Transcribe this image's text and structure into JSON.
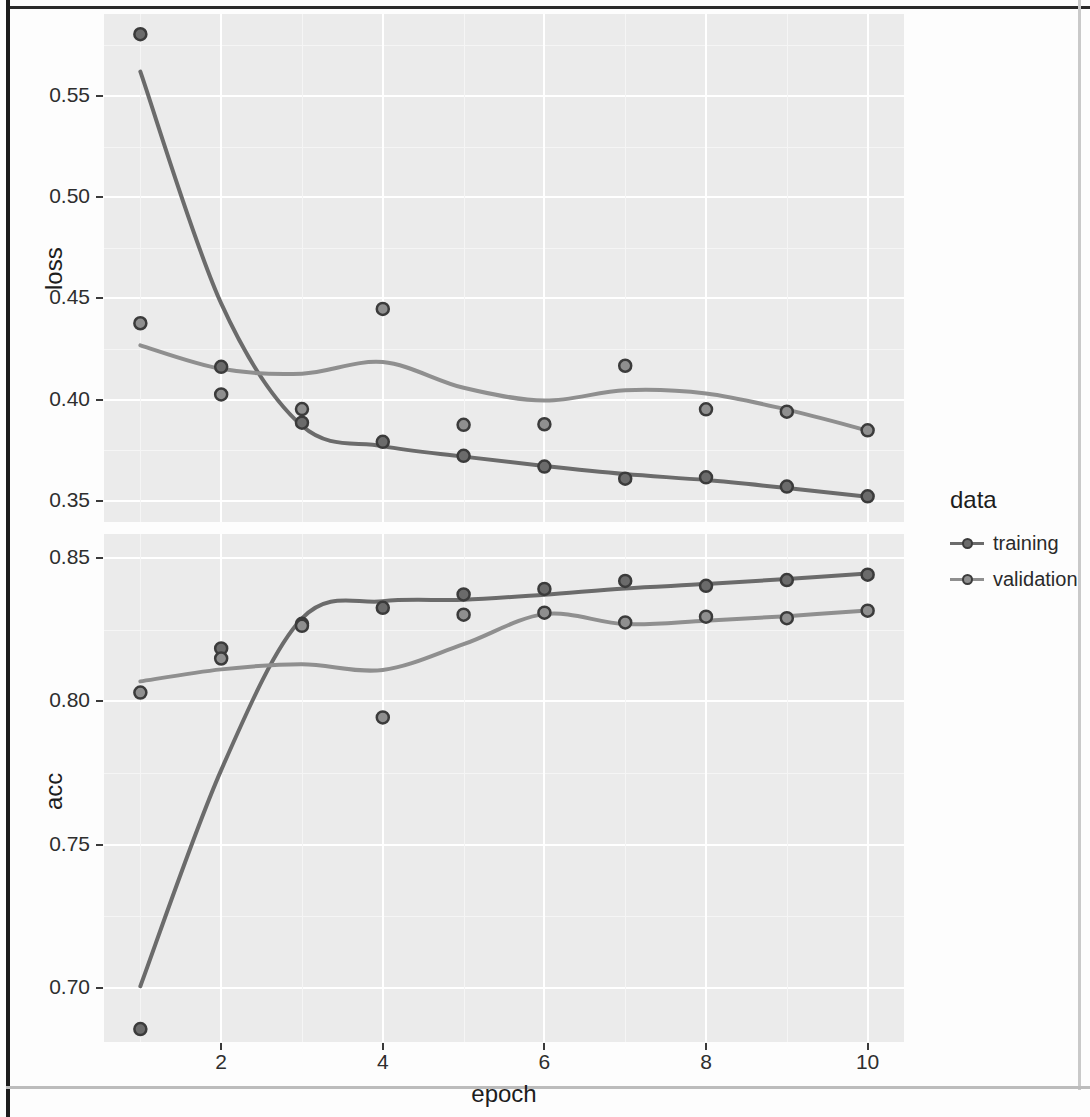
{
  "chart_data": [
    {
      "type": "scatter",
      "panel": "loss",
      "title": "",
      "xlabel": "epoch",
      "ylabel": "loss",
      "xlim": [
        0.55,
        10.45
      ],
      "ylim": [
        0.3395,
        0.5905
      ],
      "xticks": [
        2,
        4,
        6,
        8,
        10
      ],
      "xtick_labels": [
        "2",
        "4",
        "6",
        "8",
        "10"
      ],
      "yticks": [
        0.55,
        0.5,
        0.45,
        0.4,
        0.35
      ],
      "ytick_labels": [
        "0.55",
        "0.50",
        "0.45",
        "0.40",
        "0.35"
      ],
      "grid": true,
      "legend_position": "right",
      "x": [
        1,
        2,
        3,
        4,
        5,
        6,
        7,
        8,
        9,
        10
      ],
      "series": [
        {
          "name": "training",
          "values": [
            0.5805,
            0.4162,
            0.3886,
            0.3791,
            0.3722,
            0.3669,
            0.3609,
            0.3616,
            0.357,
            0.3522
          ],
          "smooth": [
            0.562,
            0.4475,
            0.387,
            0.377,
            0.3718,
            0.3672,
            0.3632,
            0.3602,
            0.3563,
            0.352
          ]
        },
        {
          "name": "validation",
          "values": [
            0.4377,
            0.4025,
            0.3953,
            0.4448,
            0.3875,
            0.3878,
            0.4167,
            0.3952,
            0.394,
            0.3848
          ],
          "smooth": [
            0.4268,
            0.4152,
            0.4128,
            0.4185,
            0.4058,
            0.3995,
            0.4046,
            0.403,
            0.395,
            0.3847
          ]
        }
      ]
    },
    {
      "type": "scatter",
      "panel": "acc",
      "title": "",
      "xlabel": "epoch",
      "ylabel": "acc",
      "xlim": [
        0.55,
        10.45
      ],
      "ylim": [
        0.681,
        0.8585
      ],
      "xticks": [
        2,
        4,
        6,
        8,
        10
      ],
      "xtick_labels": [
        "2",
        "4",
        "6",
        "8",
        "10"
      ],
      "yticks": [
        0.85,
        0.8,
        0.75,
        0.7
      ],
      "ytick_labels": [
        "0.85",
        "0.80",
        "0.75",
        "0.70"
      ],
      "grid": true,
      "legend_position": "right",
      "x": [
        1,
        2,
        3,
        4,
        5,
        6,
        7,
        8,
        9,
        10
      ],
      "series": [
        {
          "name": "training",
          "values": [
            0.6855,
            0.8185,
            0.8271,
            0.8327,
            0.8374,
            0.8393,
            0.8421,
            0.8404,
            0.8424,
            0.8443
          ],
          "smooth": [
            0.7005,
            0.776,
            0.829,
            0.835,
            0.8355,
            0.8373,
            0.8395,
            0.841,
            0.8428,
            0.8447
          ]
        },
        {
          "name": "validation",
          "values": [
            0.8031,
            0.815,
            0.8264,
            0.7944,
            0.8303,
            0.831,
            0.8276,
            0.8296,
            0.8291,
            0.8317
          ]
        }
      ],
      "validation_smooth": [
        0.807,
        0.8112,
        0.813,
        0.811,
        0.82,
        0.8305,
        0.827,
        0.8282,
        0.8298,
        0.8318
      ]
    }
  ],
  "axes": {
    "x_title": "epoch",
    "y_title_loss": "loss",
    "y_title_acc": "acc",
    "x_tick_labels": [
      "2",
      "4",
      "6",
      "8",
      "10"
    ],
    "y_tick_labels_loss": [
      "0.55",
      "0.50",
      "0.45",
      "0.40",
      "0.35"
    ],
    "y_tick_labels_acc": [
      "0.85",
      "0.80",
      "0.75",
      "0.70"
    ]
  },
  "legend": {
    "title": "data",
    "items": [
      {
        "label": "training",
        "color": "#6b6b6b"
      },
      {
        "label": "validation",
        "color": "#8f8f8f"
      }
    ]
  },
  "colors": {
    "panel_background": "#ebebeb",
    "grid_major": "#ffffff",
    "page_background": "#fdfdfd",
    "training": "#6b6b6b",
    "validation": "#8f8f8f",
    "point_stroke": "#3b3b3b",
    "text": "#1d1d1d"
  }
}
